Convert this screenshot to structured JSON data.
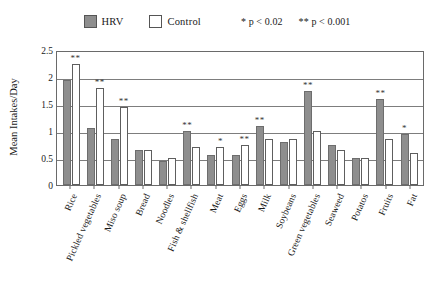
{
  "legend": {
    "hrv_label": "HRV",
    "control_label": "Control",
    "note_1": "* p < 0.02",
    "note_2": "** p < 0.001",
    "hrv_swatch_icon": "filled-square-icon",
    "control_swatch_icon": "empty-square-icon",
    "hrv_color": "#8e8e8e",
    "control_color": "#ffffff"
  },
  "chart_data": {
    "type": "bar",
    "title": "",
    "xlabel": "",
    "ylabel": "Mean Intakes/Day",
    "ylim": [
      0,
      2.5
    ],
    "yticks": [
      0,
      0.5,
      1,
      1.5,
      2,
      2.5
    ],
    "ytick_labels": [
      "0",
      "0.5",
      "1",
      "1.5",
      "2",
      "2.5"
    ],
    "grid": true,
    "legend_position": "top-center",
    "categories": [
      "Rice",
      "Pickled vegetables",
      "Miso soup",
      "Bread",
      "Noodles",
      "Fish & shellfish",
      "Meat",
      "Eggs",
      "Milk",
      "Soybeans",
      "Green vegetables",
      "Seaweed",
      "Potatos",
      "Fruits",
      "Fat"
    ],
    "series": [
      {
        "name": "HRV",
        "color": "#8e8e8e",
        "values": [
          1.95,
          1.05,
          0.85,
          0.65,
          0.45,
          1.0,
          0.55,
          0.55,
          1.1,
          0.8,
          1.75,
          0.75,
          0.5,
          1.6,
          0.95
        ]
      },
      {
        "name": "Control",
        "color": "#ffffff",
        "values": [
          2.25,
          1.8,
          1.45,
          0.65,
          0.5,
          0.7,
          0.7,
          0.75,
          0.85,
          0.85,
          1.0,
          0.65,
          0.5,
          0.85,
          0.6
        ]
      }
    ],
    "significance": [
      {
        "category": "Rice",
        "marker": "**",
        "on_series": "Control"
      },
      {
        "category": "Pickled vegetables",
        "marker": "**",
        "on_series": "Control"
      },
      {
        "category": "Miso soup",
        "marker": "**",
        "on_series": "Control"
      },
      {
        "category": "Bread",
        "marker": "",
        "on_series": ""
      },
      {
        "category": "Noodles",
        "marker": "",
        "on_series": ""
      },
      {
        "category": "Fish & shellfish",
        "marker": "**",
        "on_series": "HRV"
      },
      {
        "category": "Meat",
        "marker": "*",
        "on_series": "Control"
      },
      {
        "category": "Eggs",
        "marker": "**",
        "on_series": "Control"
      },
      {
        "category": "Milk",
        "marker": "**",
        "on_series": "HRV"
      },
      {
        "category": "Soybeans",
        "marker": "",
        "on_series": ""
      },
      {
        "category": "Green vegetables",
        "marker": "**",
        "on_series": "HRV"
      },
      {
        "category": "Seaweed",
        "marker": "",
        "on_series": ""
      },
      {
        "category": "Potatos",
        "marker": "",
        "on_series": ""
      },
      {
        "category": "Fruits",
        "marker": "**",
        "on_series": "HRV"
      },
      {
        "category": "Fat",
        "marker": "*",
        "on_series": "HRV"
      }
    ]
  }
}
